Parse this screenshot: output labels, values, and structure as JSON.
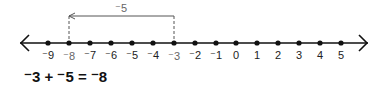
{
  "number_line": {
    "min": -9,
    "max": 5,
    "ticks": [
      {
        "value": -9,
        "label": "⁻9",
        "x": 48
      },
      {
        "value": -8,
        "label": "⁻8",
        "x": 69,
        "highlight": true
      },
      {
        "value": -7,
        "label": "⁻7",
        "x": 90
      },
      {
        "value": -6,
        "label": "⁻6",
        "x": 111
      },
      {
        "value": -5,
        "label": "⁻5",
        "x": 132
      },
      {
        "value": -4,
        "label": "⁻4",
        "x": 153
      },
      {
        "value": -3,
        "label": "⁻3",
        "x": 174,
        "highlight": true
      },
      {
        "value": -2,
        "label": "⁻2",
        "x": 195
      },
      {
        "value": -1,
        "label": "⁻1",
        "x": 216
      },
      {
        "value": 0,
        "label": "0",
        "x": 236
      },
      {
        "value": 1,
        "label": "1",
        "x": 257
      },
      {
        "value": 2,
        "label": "2",
        "x": 278
      },
      {
        "value": 3,
        "label": "3",
        "x": 299
      },
      {
        "value": 4,
        "label": "4",
        "x": 320
      },
      {
        "value": 5,
        "label": "5",
        "x": 341
      }
    ]
  },
  "jump": {
    "label": "⁻5",
    "from": -3,
    "to": -8
  },
  "equation": {
    "text": "⁻3 + ⁻5 = ⁻8"
  }
}
